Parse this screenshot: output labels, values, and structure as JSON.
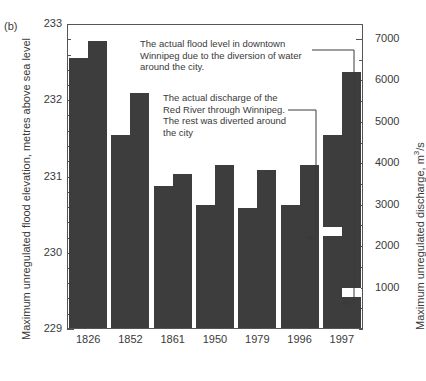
{
  "panel": {
    "label": "(b)"
  },
  "chart_data": {
    "type": "bar",
    "title": "",
    "xlabel": "",
    "categories": [
      "1826",
      "1852",
      "1861",
      "1950",
      "1979",
      "1996",
      "1997"
    ],
    "grid": false,
    "legend": "none",
    "axes": {
      "left": {
        "label": "Maximum unregulated flood elevation, metres above sea level",
        "unit": "metres above sea level",
        "min": 229,
        "max": 233,
        "major_step": 1,
        "minor_step": 0.2,
        "ticklabels": [
          "229",
          "230",
          "231",
          "232",
          "233"
        ]
      },
      "right": {
        "label": "Maximum unregulated discharge, m",
        "label_sup": "3",
        "label_tail": "/s",
        "unit": "m3/s",
        "min": 0,
        "max": 7360,
        "major_step": 1000,
        "minor_step": 500,
        "ticklabels": [
          "1000",
          "2000",
          "3000",
          "4000",
          "5000",
          "6000",
          "7000"
        ]
      }
    },
    "series": [
      {
        "name": "Maximum unregulated flood elevation",
        "axis": "left",
        "unit": "m",
        "values": [
          232.55,
          231.55,
          230.88,
          230.62,
          230.59,
          230.62,
          231.55
        ]
      },
      {
        "name": "Maximum unregulated discharge",
        "axis": "right",
        "unit": "m3/s",
        "values": [
          6940,
          5700,
          3740,
          3960,
          3840,
          3960,
          6200
        ]
      }
    ],
    "annotations": [
      {
        "id": "flood-level",
        "text": "The actual flood level in downtown Winnipeg due to the diversion of water around the city.",
        "points_to": {
          "category": "1997",
          "series": "Maximum unregulated discharge",
          "value": 1000
        }
      },
      {
        "id": "actual-discharge",
        "text": "The actual discharge of the Red River through Winnipeg.  The rest was diverted around the city",
        "points_to": {
          "category": "1997",
          "series": "Maximum unregulated flood elevation",
          "value": 2450
        }
      }
    ],
    "markers": [
      {
        "category": "1997",
        "series": "Maximum unregulated flood elevation",
        "type": "white-notch",
        "value": 2450
      },
      {
        "category": "1997",
        "series": "Maximum unregulated discharge",
        "type": "white-notch",
        "value": 1000
      }
    ],
    "colors": {
      "bar": "#3d3d3d",
      "axis": "#555555",
      "text": "#3a3a3a",
      "background": "#ffffff"
    }
  }
}
